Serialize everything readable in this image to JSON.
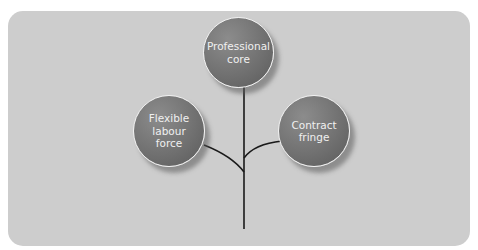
{
  "diagram": {
    "type": "tree",
    "nodes": [
      {
        "id": "professional-core",
        "label": "Professional\ncore"
      },
      {
        "id": "flexible-labour-force",
        "label": "Flexible\nlabour\nforce"
      },
      {
        "id": "contract-fringe",
        "label": "Contract\nfringe"
      }
    ],
    "edges": [
      {
        "from": "stem",
        "to": "professional-core"
      },
      {
        "from": "stem",
        "to": "flexible-labour-force"
      },
      {
        "from": "stem",
        "to": "contract-fringe"
      }
    ]
  },
  "colors": {
    "panel": "#cdcdcd",
    "node_fill": "#717171",
    "node_border": "#f2f2f2",
    "line": "#1a1a1a"
  }
}
